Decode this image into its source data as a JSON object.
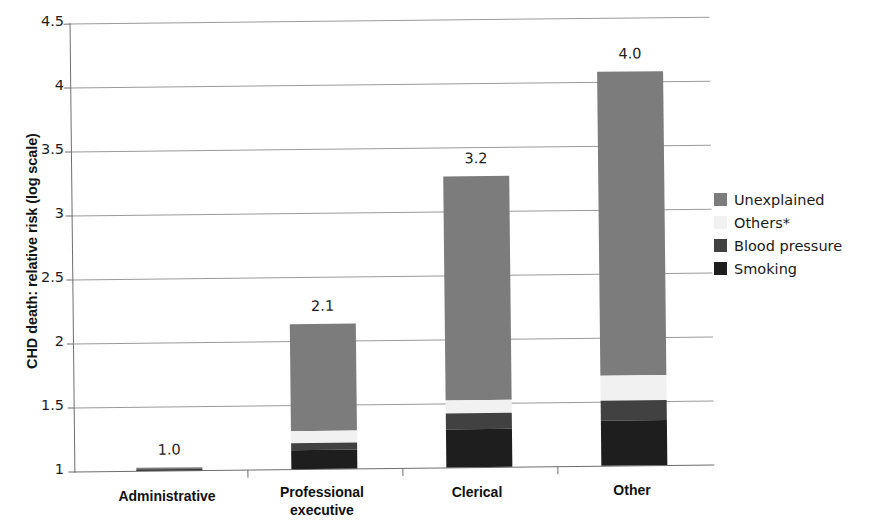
{
  "chart_data": {
    "type": "bar",
    "title": "",
    "subtitle": "",
    "xlabel": "",
    "ylabel": "CHD death: relative risk (log scale)",
    "categories": [
      "Administrative",
      "Professional executive",
      "Clerical",
      "Other"
    ],
    "category_lines": [
      [
        "Administrative"
      ],
      [
        "Professional",
        "executive"
      ],
      [
        "Clerical"
      ],
      [
        "Other"
      ]
    ],
    "data_labels": [
      "1.0",
      "2.1",
      "3.2",
      "4.0"
    ],
    "totals": [
      1.02,
      2.13,
      3.27,
      4.08
    ],
    "ylim": [
      1,
      4.5
    ],
    "yticks": [
      1,
      1.5,
      2,
      2.5,
      3,
      3.5,
      4,
      4.5
    ],
    "ytick_labels": [
      "1",
      "1.5",
      "2",
      "2.5",
      "3",
      "3.5",
      "4",
      "4.5"
    ],
    "grid": true,
    "stacked": true,
    "legend_position": "right",
    "series": [
      {
        "name": "Unexplained",
        "color": "#7c7c7c",
        "segment_tops": [
          1.02,
          2.13,
          3.27,
          4.08
        ],
        "segment_bottoms": [
          1.0,
          1.3,
          1.52,
          1.7
        ],
        "values": [
          0.02,
          0.83,
          1.75,
          2.38
        ]
      },
      {
        "name": "Others*",
        "color": "#f1f1f1",
        "segment_tops": [
          1.0,
          1.3,
          1.52,
          1.7
        ],
        "segment_bottoms": [
          1.0,
          1.2,
          1.42,
          1.51
        ],
        "values": [
          0.0,
          0.1,
          0.1,
          0.19
        ]
      },
      {
        "name": "Blood pressure",
        "color": "#414141",
        "segment_tops": [
          1.0,
          1.2,
          1.42,
          1.51
        ],
        "segment_bottoms": [
          1.0,
          1.15,
          1.3,
          1.35
        ],
        "values": [
          0.0,
          0.05,
          0.12,
          0.16
        ]
      },
      {
        "name": "Smoking",
        "color": "#1e1e1e",
        "segment_tops": [
          1.01,
          1.15,
          1.3,
          1.35
        ],
        "segment_bottoms": [
          1.0,
          1.0,
          1.0,
          1.0
        ],
        "values": [
          0.01,
          0.15,
          0.3,
          0.35
        ]
      }
    ]
  },
  "legend": {
    "items": [
      {
        "label": "Unexplained",
        "color": "#7c7c7c"
      },
      {
        "label": "Others*",
        "color": "#f1f1f1"
      },
      {
        "label": "Blood pressure",
        "color": "#414141"
      },
      {
        "label": "Smoking",
        "color": "#1e1e1e"
      }
    ]
  }
}
